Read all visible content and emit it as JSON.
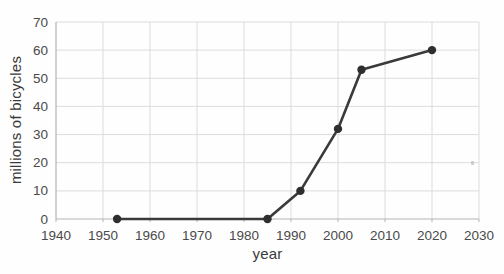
{
  "chart_data": {
    "type": "line",
    "title": "",
    "xlabel": "year",
    "ylabel": "millions of bicycles",
    "xlim": [
      1940,
      2030
    ],
    "ylim": [
      0,
      70
    ],
    "x_ticks": [
      1940,
      1950,
      1960,
      1970,
      1980,
      1990,
      2000,
      2010,
      2020,
      2030
    ],
    "y_ticks": [
      0,
      10,
      20,
      30,
      40,
      50,
      60,
      70
    ],
    "grid": true,
    "legend": "none",
    "series": [
      {
        "name": "millions of bicycles",
        "points": [
          [
            1953,
            0
          ],
          [
            1985,
            0
          ],
          [
            1992,
            10
          ],
          [
            2000,
            32
          ],
          [
            2005,
            53
          ],
          [
            2020,
            60
          ]
        ]
      }
    ],
    "colors": {
      "line": "#3a3a3a",
      "marker": "#2e2e2e",
      "grid": "#dcdcdc",
      "axis": "#b3b3b3",
      "tick_text": "#4a4a4a",
      "axis_title_text": "#3a3a3a",
      "background": "#fefefe"
    }
  }
}
